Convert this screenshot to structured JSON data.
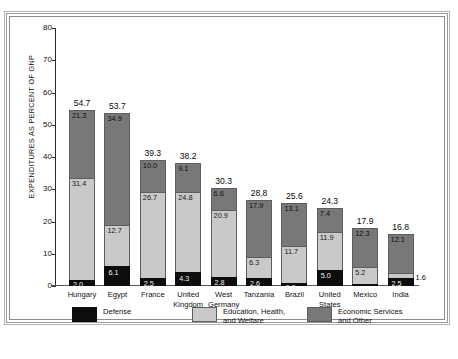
{
  "chart_data": {
    "type": "bar",
    "subtype": "stacked-vertical",
    "title": "",
    "xlabel": "",
    "ylabel": "EXPENDITURES AS PERCENT OF GNP",
    "ylim": [
      0,
      80
    ],
    "yticks": [
      "0",
      "10",
      "20",
      "30",
      "40",
      "50",
      "60",
      "70",
      "80"
    ],
    "grid": false,
    "legend_position": "bottom",
    "categories": [
      "Hungary",
      "Egypt",
      "France",
      "United\nKingdom",
      "West\nGermany",
      "Tanzania",
      "Brazil",
      "United\nStates",
      "Mexico",
      "India"
    ],
    "series": [
      {
        "name": "Defense",
        "color": "#0d0d0d",
        "values": [
          2.0,
          6.1,
          2.5,
          4.3,
          2.8,
          2.6,
          0.8,
          5.0,
          0.4,
          2.5
        ]
      },
      {
        "name": "Education, Health,\nand Welfare",
        "color": "#c9c9c9",
        "values": [
          31.4,
          12.7,
          26.7,
          24.8,
          20.9,
          6.3,
          11.7,
          11.9,
          5.2,
          1.6
        ]
      },
      {
        "name": "Economic Services\nand Other",
        "color": "#787878",
        "values": [
          21.3,
          34.9,
          10.0,
          9.1,
          6.6,
          17.9,
          13.1,
          7.4,
          12.3,
          12.1
        ]
      }
    ],
    "totals": [
      54.7,
      53.7,
      39.3,
      38.2,
      30.3,
      28.8,
      25.6,
      24.3,
      17.9,
      16.8
    ],
    "label_outside": {
      "Hungary": [
        "Defense"
      ],
      "Brazil": [
        "Defense"
      ],
      "Mexico": [
        "Defense"
      ],
      "India": [
        "Education, Health, and Welfare"
      ]
    }
  },
  "legend": {
    "items": [
      {
        "label": "Defense",
        "color": "#0d0d0d"
      },
      {
        "label": "Education, Health,\nand Welfare",
        "color": "#c9c9c9"
      },
      {
        "label": "Economic Services\nand Other",
        "color": "#787878"
      }
    ]
  }
}
